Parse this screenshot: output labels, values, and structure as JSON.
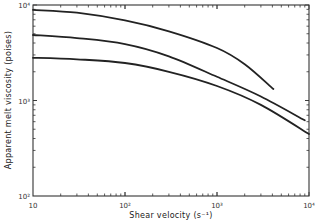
{
  "chart_data": {
    "type": "line",
    "title": "",
    "xlabel": "Shear velocity (s⁻¹)",
    "ylabel": "Apparent melt viscosity (poises)",
    "xscale": "log",
    "yscale": "log",
    "xlim": [
      10,
      10000
    ],
    "ylim": [
      100,
      10000
    ],
    "grid": false,
    "legend": null,
    "x_ticks": [
      {
        "value": 10,
        "label": "10"
      },
      {
        "value": 100,
        "label": "10²"
      },
      {
        "value": 1000,
        "label": "10³"
      },
      {
        "value": 10000,
        "label": "10⁴"
      }
    ],
    "y_ticks": [
      {
        "value": 100,
        "label": "10²"
      },
      {
        "value": 1000,
        "label": "10³"
      },
      {
        "value": 10000,
        "label": "10⁴"
      }
    ],
    "series": [
      {
        "name": "upper curve",
        "x": [
          10,
          30,
          100,
          300,
          1000,
          2000,
          4100
        ],
        "y": [
          8900,
          8300,
          6900,
          5300,
          3550,
          2400,
          1320
        ]
      },
      {
        "name": "middle curve",
        "x": [
          10,
          30,
          100,
          300,
          1000,
          3000,
          9000
        ],
        "y": [
          4850,
          4500,
          3900,
          2900,
          1770,
          1100,
          620
        ]
      },
      {
        "name": "lower curve",
        "x": [
          10,
          30,
          100,
          300,
          1000,
          3000,
          10000
        ],
        "y": [
          2800,
          2700,
          2470,
          2000,
          1420,
          900,
          445
        ]
      }
    ]
  }
}
